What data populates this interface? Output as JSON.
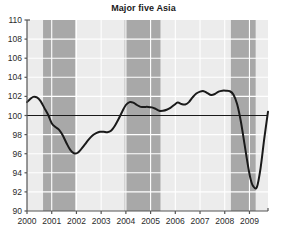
{
  "chart_data": {
    "type": "line",
    "title": "Major five Asia",
    "xlabel": "",
    "ylabel": "",
    "xlim": [
      2000.0,
      2009.75
    ],
    "ylim": [
      90,
      110
    ],
    "grid": true,
    "legend": "none",
    "yticks": [
      90,
      92,
      94,
      96,
      98,
      100,
      102,
      104,
      106,
      108,
      110
    ],
    "ytick_labels": [
      "90",
      "92",
      "94",
      "96",
      "98",
      "100",
      "102",
      "104",
      "106",
      "108",
      "110"
    ],
    "xticks": [
      2000,
      2001,
      2002,
      2003,
      2004,
      2005,
      2006,
      2007,
      2008,
      2009
    ],
    "xtick_labels": [
      "2000",
      "2001",
      "2002",
      "2003",
      "2004",
      "2005",
      "2006",
      "2007",
      "2008",
      "2009"
    ],
    "reference_line": {
      "value": 100,
      "orientation": "horizontal",
      "color": "#1a1a1a"
    },
    "shaded_bands": [
      {
        "start": 2000.65,
        "end": 2001.95,
        "color": "#a8a8a8",
        "label": "recession-band-1"
      },
      {
        "start": 2003.95,
        "end": 2005.4,
        "color": "#a8a8a8",
        "label": "recession-band-2"
      },
      {
        "start": 2008.25,
        "end": 2009.25,
        "color": "#a8a8a8",
        "label": "recession-band-3"
      }
    ],
    "series": [
      {
        "name": "Major five Asia",
        "color": "#1a1a1a",
        "x": [
          2000.0,
          2000.12,
          2000.25,
          2000.4,
          2000.55,
          2000.7,
          2000.85,
          2001.0,
          2001.15,
          2001.3,
          2001.45,
          2001.6,
          2001.75,
          2001.9,
          2002.05,
          2002.2,
          2002.35,
          2002.5,
          2002.65,
          2002.8,
          2002.95,
          2003.1,
          2003.25,
          2003.4,
          2003.55,
          2003.7,
          2003.85,
          2004.0,
          2004.15,
          2004.3,
          2004.45,
          2004.6,
          2004.75,
          2004.9,
          2005.05,
          2005.2,
          2005.35,
          2005.5,
          2005.65,
          2005.8,
          2005.95,
          2006.1,
          2006.25,
          2006.4,
          2006.55,
          2006.7,
          2006.85,
          2007.0,
          2007.15,
          2007.3,
          2007.45,
          2007.6,
          2007.75,
          2007.9,
          2008.05,
          2008.2,
          2008.35,
          2008.5,
          2008.65,
          2008.8,
          2008.95,
          2009.05,
          2009.15,
          2009.3,
          2009.45,
          2009.6,
          2009.75
        ],
        "y": [
          101.4,
          101.7,
          101.95,
          101.9,
          101.5,
          100.8,
          100.1,
          99.2,
          98.8,
          98.5,
          97.9,
          97.1,
          96.4,
          96.05,
          96.1,
          96.5,
          97.0,
          97.5,
          97.9,
          98.15,
          98.3,
          98.3,
          98.25,
          98.4,
          98.9,
          99.6,
          100.4,
          101.1,
          101.4,
          101.35,
          101.1,
          100.9,
          100.9,
          100.9,
          100.85,
          100.7,
          100.5,
          100.5,
          100.6,
          100.8,
          101.1,
          101.35,
          101.2,
          101.15,
          101.4,
          101.9,
          102.3,
          102.5,
          102.55,
          102.35,
          102.15,
          102.25,
          102.5,
          102.6,
          102.6,
          102.55,
          102.2,
          101.2,
          99.4,
          97.0,
          94.6,
          93.3,
          92.6,
          92.5,
          94.5,
          97.6,
          100.4
        ]
      }
    ],
    "annotations": []
  },
  "colors": {
    "plot_background": "#ececec",
    "band": "#a8a8a8",
    "gridline": "#ffffff",
    "axis": "#555555",
    "line": "#1a1a1a",
    "text": "#2b2b2b",
    "page_background": "#ffffff"
  },
  "geometry": {
    "plot_left": 27,
    "plot_right": 268,
    "plot_top": 20,
    "plot_bottom": 211
  }
}
